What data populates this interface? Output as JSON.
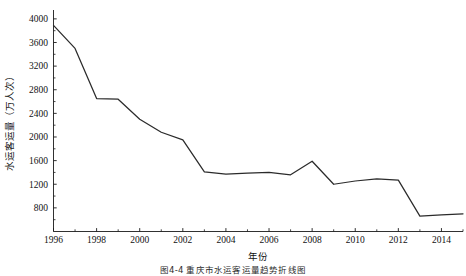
{
  "figure": {
    "caption": "图4-4  重庆市水运客运量趋势折线图",
    "background_color": "#ffffff",
    "line_color": "#2b2b2b",
    "axis_color": "#1a1a1a"
  },
  "chart_data": {
    "type": "line",
    "title": "",
    "subtitle": "",
    "xlabel": "年份",
    "ylabel": "水运客运量（万人次）",
    "xlim": [
      1996,
      2015
    ],
    "ylim": [
      400,
      4150
    ],
    "grid": false,
    "legend": "none",
    "x_tick_labels": [
      "1996",
      "1998",
      "2000",
      "2002",
      "2004",
      "2006",
      "2008",
      "2010",
      "2012",
      "2014"
    ],
    "x_tick_values": [
      1996,
      1998,
      2000,
      2002,
      2004,
      2006,
      2008,
      2010,
      2012,
      2014
    ],
    "x_minor_ticks": [
      1997,
      1999,
      2001,
      2003,
      2005,
      2007,
      2009,
      2011,
      2013,
      2015
    ],
    "y_tick_labels": [
      "800",
      "1200",
      "1600",
      "2000",
      "2400",
      "2800",
      "3200",
      "3600",
      "4000"
    ],
    "y_tick_values": [
      800,
      1200,
      1600,
      2000,
      2400,
      2800,
      3200,
      3600,
      4000
    ],
    "x": [
      1996,
      1997,
      1998,
      1999,
      2000,
      2001,
      2002,
      2003,
      2004,
      2005,
      2006,
      2007,
      2008,
      2009,
      2010,
      2011,
      2012,
      2013,
      2014,
      2015
    ],
    "series": [
      {
        "name": "水运客运量",
        "values": [
          3890,
          3500,
          2650,
          2640,
          2300,
          2080,
          1950,
          1410,
          1370,
          1390,
          1400,
          1360,
          1590,
          1200,
          1255,
          1290,
          1270,
          660,
          680,
          700
        ]
      }
    ]
  }
}
